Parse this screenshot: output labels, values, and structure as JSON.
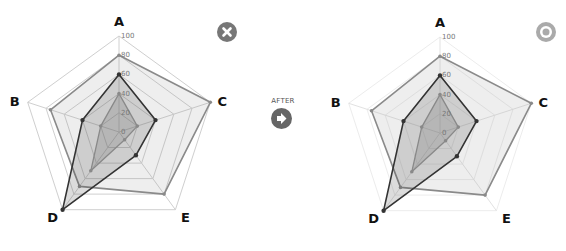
{
  "chart_data": [
    {
      "type": "radar",
      "name": "before",
      "categories": [
        "A",
        "C",
        "E",
        "D",
        "B"
      ],
      "ticks": [
        "0",
        "20",
        "40",
        "60",
        "80",
        "100"
      ],
      "range": [
        0,
        100
      ],
      "grid": true,
      "grid_style": "visible",
      "series": [
        {
          "name": "series-dark",
          "values": {
            "A": 60,
            "B": 40,
            "C": 40,
            "D": 100,
            "E": 30
          },
          "color": "#333333"
        },
        {
          "name": "series-medium",
          "values": {
            "A": 80,
            "B": 75,
            "C": 100,
            "D": 70,
            "E": 80
          },
          "color": "#8a8a8a"
        },
        {
          "name": "series-light",
          "values": {
            "A": 40,
            "B": 20,
            "C": 20,
            "D": 50,
            "E": 10
          },
          "color": "#9a9a9a"
        }
      ]
    },
    {
      "type": "radar",
      "name": "after",
      "categories": [
        "A",
        "C",
        "E",
        "D",
        "B"
      ],
      "ticks": [
        "0",
        "20",
        "40",
        "60",
        "80",
        "100"
      ],
      "range": [
        0,
        100
      ],
      "grid": true,
      "grid_style": "faint",
      "series": [
        {
          "name": "series-dark",
          "values": {
            "A": 60,
            "B": 40,
            "C": 40,
            "D": 100,
            "E": 30
          },
          "color": "#333333"
        },
        {
          "name": "series-medium",
          "values": {
            "A": 80,
            "B": 75,
            "C": 100,
            "D": 70,
            "E": 80
          },
          "color": "#8a8a8a"
        },
        {
          "name": "series-light",
          "values": {
            "A": 40,
            "B": 20,
            "C": 20,
            "D": 50,
            "E": 10
          },
          "color": "#9a9a9a"
        }
      ]
    }
  ],
  "labels": {
    "after": "AFTER"
  },
  "icons": {
    "close": "close-icon",
    "after_arrow": "arrow-right-icon",
    "target": "target-icon"
  },
  "colors": {
    "close_bg": "#777777",
    "target_bg": "#aaaaaa",
    "arrow_bg": "#666666"
  }
}
